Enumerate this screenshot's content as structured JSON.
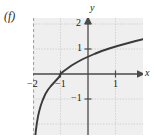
{
  "figure": {
    "part_label": "(f)",
    "background_color": "#ffffff",
    "plot_background_color": "#efefef",
    "grid_color": "#c9c9c9",
    "axis_color": "#4a4a4a",
    "curve_color": "#3a3a3a",
    "asymptote_color": "#9a9a9a"
  },
  "axes": {
    "x_name": "x",
    "y_name": "y",
    "x_ticks": [
      {
        "label": "−2",
        "value": -2
      },
      {
        "label": "−1",
        "value": -1
      },
      {
        "label": "1",
        "value": 1
      }
    ],
    "y_ticks": [
      {
        "label": "2",
        "value": 2
      },
      {
        "label": "1",
        "value": 1
      },
      {
        "label": "−1",
        "value": -1
      }
    ]
  },
  "chart_data": {
    "type": "line",
    "title": "(f)",
    "xlabel": "x",
    "ylabel": "y",
    "xlim": [
      -2.2,
      2.2
    ],
    "ylim": [
      -2.0,
      2.7
    ],
    "grid": true,
    "legend": "none",
    "x_ticks": [
      -2,
      -1,
      1
    ],
    "x_tick_labels": [
      "−2",
      "−1",
      "1"
    ],
    "y_ticks": [
      2,
      1,
      -1
    ],
    "y_tick_labels": [
      "2",
      "1",
      "−1"
    ],
    "series": [
      {
        "name": "y = ln(x + 2)",
        "x": [
          -1.93,
          -1.9,
          -1.86,
          -1.82,
          -1.78,
          -1.72,
          -1.65,
          -1.55,
          -1.45,
          -1.35,
          -1.25,
          -1.15,
          -1.05,
          -1.0,
          -0.9,
          -0.75,
          -0.6,
          -0.4,
          -0.2,
          0.0,
          0.25,
          0.5,
          0.8,
          1.1,
          1.4,
          1.7,
          2.0,
          2.2
        ],
        "y": [
          -2.66,
          -2.3,
          -1.97,
          -1.71,
          -1.51,
          -1.27,
          -1.05,
          -0.8,
          -0.62,
          -0.48,
          -0.36,
          -0.24,
          -0.12,
          0.0,
          0.1,
          0.22,
          0.34,
          0.47,
          0.59,
          0.69,
          0.81,
          0.92,
          1.03,
          1.13,
          1.22,
          1.31,
          1.39,
          1.44
        ]
      }
    ],
    "annotations": [
      {
        "name": "vertical-asymptote",
        "type": "vertical-line",
        "x": -2,
        "style": "dashed"
      }
    ]
  }
}
